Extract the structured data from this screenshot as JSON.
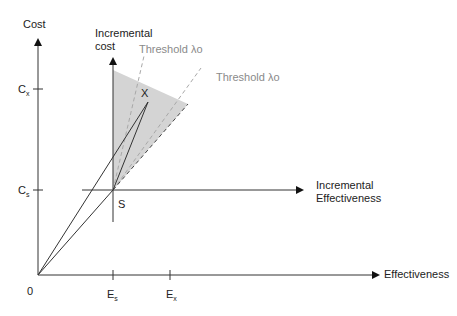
{
  "diagram": {
    "axes": {
      "y_label": "Cost",
      "x_label": "Effectiveness",
      "origin_label": "0",
      "incremental_y_label_line1": "Incremental",
      "incremental_y_label_line2": "cost",
      "incremental_x_label_line1": "Incremental",
      "incremental_x_label_line2": "Effectiveness"
    },
    "ticks": {
      "cx_main": "C",
      "cx_sub": "x",
      "cs_main": "C",
      "cs_sub": "s",
      "es_main": "E",
      "es_sub": "s",
      "ex_main": "E",
      "ex_sub": "x"
    },
    "points": {
      "s_label": "S",
      "x_label": "X"
    },
    "thresholds": {
      "steep_label": "Threshold λo",
      "shallow_label": "Threshold λo"
    },
    "colors": {
      "axis": "#333333",
      "shade": "#d4d4d4",
      "dashed_grey": "#a8a8a8",
      "dashed_dark": "#444444",
      "threshold_text": "#8a8a8a"
    }
  }
}
